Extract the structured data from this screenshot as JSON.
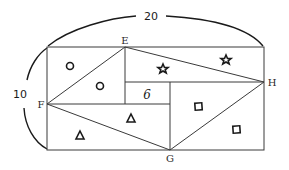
{
  "diagram": {
    "dimensions": {
      "width_label": "20",
      "height_label": "10"
    },
    "points": {
      "E": "E",
      "F": "F",
      "G": "G",
      "H": "H"
    },
    "inner_square_label": "6",
    "region_symbols": [
      {
        "shape": "circle",
        "region": "top-left corner triangle",
        "count": 1
      },
      {
        "shape": "circle",
        "region": "triangle EF side inside",
        "count": 1
      },
      {
        "shape": "star",
        "region": "triangle EH side inside",
        "count": 1
      },
      {
        "shape": "star",
        "region": "top-right corner triangle",
        "count": 1
      },
      {
        "shape": "square",
        "region": "triangle GH side inside",
        "count": 1
      },
      {
        "shape": "square",
        "region": "bottom-right corner triangle",
        "count": 1
      },
      {
        "shape": "triangle",
        "region": "triangle FG side inside",
        "count": 1
      },
      {
        "shape": "triangle",
        "region": "bottom-left corner triangle",
        "count": 1
      }
    ]
  }
}
